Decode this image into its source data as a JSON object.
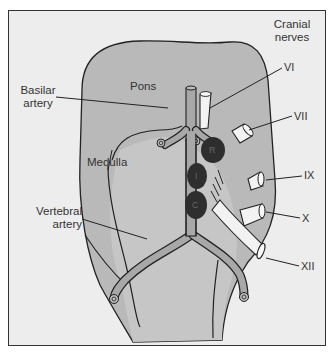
{
  "diagram": {
    "colors": {
      "background": "#ededed",
      "brainstem_fill": "#b9b9b9",
      "artery_fill": "#a8a8a8",
      "nucleus_fill": "#2e2e2e",
      "nerve_fill": "#f2f2f2",
      "outline": "#222222"
    },
    "labels": {
      "cranial_nerves_line1": "Cranial",
      "cranial_nerves_line2": "nerves",
      "basilar_line1": "Basilar",
      "basilar_line2": "artery",
      "pons": "Pons",
      "medulla": "Medulla",
      "vertebral_line1": "Vertebral",
      "vertebral_line2": "artery"
    },
    "nerves": [
      {
        "id": "VI",
        "label": "VI"
      },
      {
        "id": "VII",
        "label": "VII"
      },
      {
        "id": "IX",
        "label": "IX"
      },
      {
        "id": "X",
        "label": "X"
      },
      {
        "id": "XII",
        "label": "XII"
      }
    ],
    "nuclei": [
      {
        "id": "R",
        "label": "R"
      },
      {
        "id": "I",
        "label": "I"
      },
      {
        "id": "C",
        "label": "C"
      }
    ]
  }
}
